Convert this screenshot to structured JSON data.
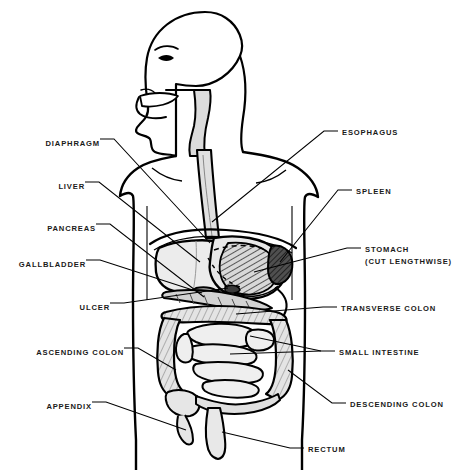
{
  "figure": {
    "background_color": "#ffffff",
    "line_color": "#000000",
    "organ_fill_light": "#ececec",
    "organ_fill_mid": "#cfcfcf",
    "organ_fill_dark": "#4a4a4a"
  },
  "labels_left": [
    {
      "id": "diaphragm",
      "text": "DIAPHRAGM",
      "x": 38,
      "y": 142
    },
    {
      "id": "liver",
      "text": "LIVER",
      "x": 57,
      "y": 185
    },
    {
      "id": "pancreas",
      "text": "PANCREAS",
      "x": 38,
      "y": 227
    },
    {
      "id": "gallbladder",
      "text": "GALLBLADDER",
      "x": 12,
      "y": 263
    },
    {
      "id": "ulcer",
      "text": "ULCER",
      "x": 71,
      "y": 306
    },
    {
      "id": "ascending-colon",
      "text": "ASCENDING COLON",
      "x": 14,
      "y": 351
    },
    {
      "id": "appendix",
      "text": "APPENDIX",
      "x": 38,
      "y": 405
    }
  ],
  "labels_right": [
    {
      "id": "esophagus",
      "text": "ESOPHAGUS",
      "x": 342,
      "y": 134
    },
    {
      "id": "spleen",
      "text": "SPLEEN",
      "x": 356,
      "y": 193
    },
    {
      "id": "stomach",
      "text": "STOMACH",
      "x": 365,
      "y": 251
    },
    {
      "id": "stomach-note",
      "text": "(CUT LENGTHWISE)",
      "x": 365,
      "y": 263
    },
    {
      "id": "transverse-colon",
      "text": "TRANSVERSE COLON",
      "x": 341,
      "y": 310
    },
    {
      "id": "small-intestine",
      "text": "SMALL INTESTINE",
      "x": 339,
      "y": 354
    },
    {
      "id": "descending-colon",
      "text": "DESCENDING COLON",
      "x": 350,
      "y": 406
    },
    {
      "id": "rectum",
      "text": "RECTUM",
      "x": 308,
      "y": 451
    }
  ]
}
